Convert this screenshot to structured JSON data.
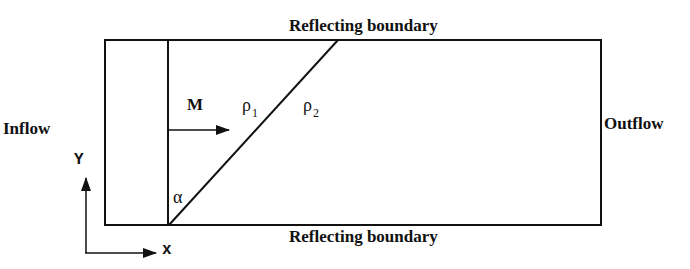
{
  "diagram": {
    "top_boundary_label": "Reflecting boundary",
    "bottom_boundary_label": "Reflecting boundary",
    "inflow_label": "Inflow",
    "outflow_label": "Outflow",
    "mach_label": "M",
    "region1": {
      "symbol": "ρ",
      "subscript": "1"
    },
    "region2": {
      "symbol": "ρ",
      "subscript": "2"
    },
    "angle_label": "α",
    "axis_x_label": "x",
    "axis_y_label": "Y",
    "line_color": "#111111",
    "background_color": "#ffffff"
  }
}
